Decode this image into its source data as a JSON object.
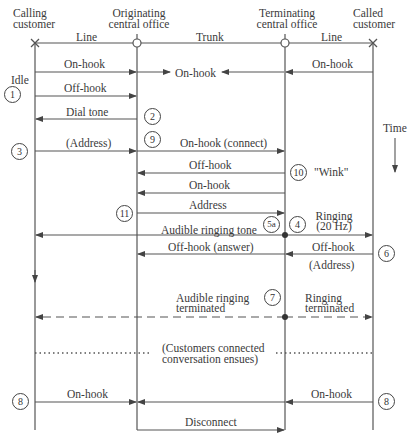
{
  "headers": {
    "calling": [
      "Calling",
      "customer"
    ],
    "originating": [
      "Originating",
      "central office"
    ],
    "terminating": [
      "Terminating",
      "central office"
    ],
    "called": [
      "Called",
      "customer"
    ]
  },
  "segments": {
    "line_left": "Line",
    "trunk": "Trunk",
    "line_right": "Line"
  },
  "side_labels": {
    "idle": "Idle",
    "time": "Time",
    "wink": "\"Wink\""
  },
  "messages": {
    "on_hook_left": "On-hook",
    "on_hook_mid": "On-hook",
    "on_hook_right": "On-hook",
    "off_hook": "Off-hook",
    "dial_tone": "Dial tone",
    "address_paren": "(Address)",
    "on_hook_connect": "On-hook (connect)",
    "off_hook_trunk": "Off-hook",
    "on_hook_trunk": "On-hook",
    "address_trunk": "Address",
    "ringing": "Ringing",
    "ringing_hz": "(20 Hz)",
    "audible_ringing_tone": "Audible ringing tone",
    "off_hook_answer": "Off-hook (answer)",
    "off_hook_called": "Off-hook",
    "address_called": "(Address)",
    "audible_ringing_terminated_1": "Audible ringing",
    "audible_ringing_terminated_2": "terminated",
    "ringing_terminated_1": "Ringing",
    "ringing_terminated_2": "terminated",
    "connected_1": "(Customers connected",
    "connected_2": "conversation ensues)",
    "on_hook_end_left": "On-hook",
    "on_hook_end_right": "On-hook",
    "disconnect": "Disconnect"
  },
  "steps": {
    "s1": "1",
    "s2": "2",
    "s3": "3",
    "s4": "4",
    "s5a": "5a",
    "s6": "6",
    "s7": "7",
    "s8_left": "8",
    "s8_right": "8",
    "s9": "9",
    "s10": "10",
    "s11": "11"
  }
}
